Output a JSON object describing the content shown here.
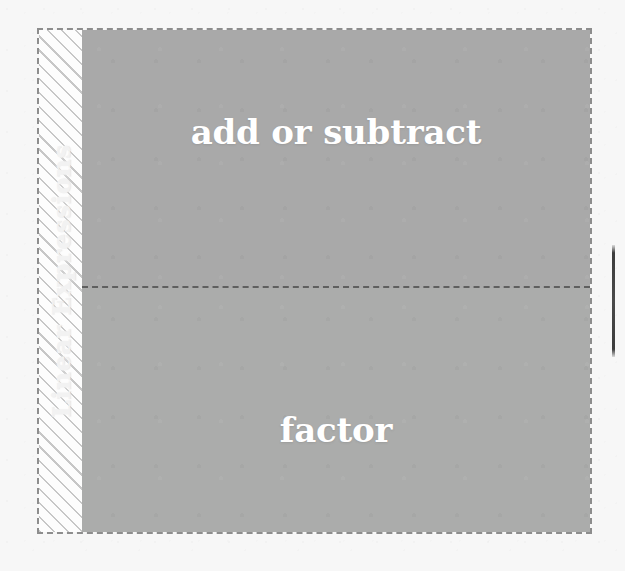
{
  "diagram": {
    "spine": {
      "label": "Linear Expressions"
    },
    "blocks": [
      {
        "label": "add or subtract"
      },
      {
        "label": "factor"
      }
    ]
  },
  "colors": {
    "page_background": "#f7f7f7",
    "block_fill": "#a9a9a9",
    "block_fill_lower": "#abacab",
    "block_label_text": "#ffffff",
    "spine_label_text": "#f2f2f2",
    "outer_border": "#8d8d8d",
    "divider": "#5f5f5f",
    "hatch_line": "#9b9b9b",
    "edge_tab": "#3c3c3c"
  }
}
